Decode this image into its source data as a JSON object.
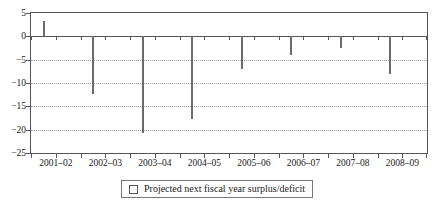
{
  "chart_data": {
    "type": "bar",
    "title": "",
    "xlabel": "",
    "ylabel": "",
    "categories": [
      "2001–02",
      "2002–03",
      "2003–04",
      "2004–05",
      "2005–06",
      "2006–07",
      "2007–08",
      "2008–09"
    ],
    "series": [
      {
        "name": "Projected next fiscal year surplus/deficit",
        "values": [
          3.2,
          -12.4,
          -20.8,
          -17.8,
          -7.1,
          -3.9,
          -2.4,
          -8.0
        ]
      }
    ],
    "ylim": [
      -25,
      5
    ],
    "yticks": [
      5,
      0,
      -5,
      -10,
      -15,
      -20,
      -25
    ],
    "ytick_labels": [
      "5",
      "0",
      "−5",
      "−10",
      "−15",
      "−20",
      "−25"
    ],
    "grid": "horizontal-dotted",
    "legend_position": "bottom-center",
    "colors": {
      "bar_fill": "#ffffff",
      "bar_edge": "#6b6b6b",
      "axis": "#555555",
      "grid": "#9a9a9a",
      "text": "#1a1a1a",
      "background": "#ffffff"
    }
  },
  "legend": {
    "swatch_name": "open-square-swatch",
    "label": "Projected next fiscal year surplus/deficit"
  }
}
